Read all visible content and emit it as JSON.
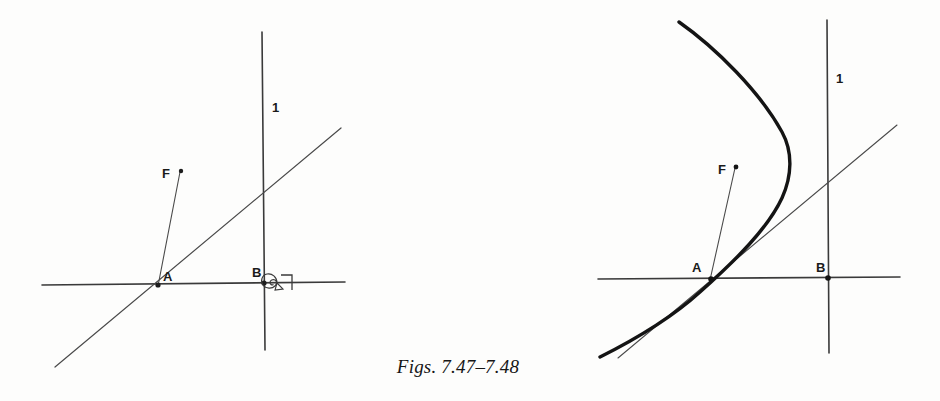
{
  "plate": {
    "caption": "Figs. 7.47–7.48",
    "background_color": "#fdfdfc",
    "ink_color": "#2a2a2a"
  },
  "figures": [
    {
      "id": "fig-7-47",
      "name": "figure-left",
      "labels": {
        "point_a": "A",
        "point_b": "B",
        "point_f": "F",
        "line_l": "1"
      },
      "elements": {
        "horizontal_line": "baseline through A and B",
        "vertical_line": "line l through B",
        "oblique_line": "line through A rising to the right",
        "focus_segment": "segment from A to focus point F",
        "right_angle_mark": "right-angle mark at B",
        "spiral_mark": "small spiral glyph at B"
      }
    },
    {
      "id": "fig-7-48",
      "name": "figure-right",
      "labels": {
        "point_a": "A",
        "point_b": "B",
        "point_f": "F",
        "line_l": "1"
      },
      "elements": {
        "horizontal_line": "baseline through A and B",
        "vertical_line": "directrix l through B",
        "oblique_line": "tangent line through A rising to the right",
        "focus_segment": "segment from A to focus point F",
        "parabola": "heavy parabolic curve opening to the left, tangent at A"
      }
    }
  ]
}
